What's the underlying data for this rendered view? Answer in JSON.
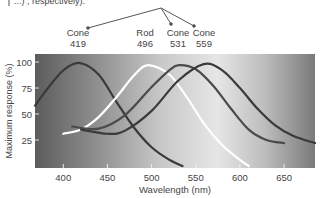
{
  "caption_fragment": "...) , respectively).",
  "chart_data": {
    "type": "line",
    "title": "",
    "xlabel": "Wavelength (nm)",
    "ylabel": "Maximum response (%)",
    "xlim": [
      368,
      685
    ],
    "ylim": [
      0,
      103
    ],
    "xticks": [
      400,
      450,
      500,
      550,
      600,
      650
    ],
    "yticks": [
      25,
      50,
      75,
      100
    ],
    "grid": false,
    "legend": "annotations above plot",
    "background": "grayscale gradient: dark at violet end, light around 550-600 nm, darker toward red end",
    "series": [
      {
        "name": "Cone 419",
        "peak_nm": 419,
        "color": "#3a3a3a",
        "x": [
          368,
          380,
          400,
          419,
          440,
          460,
          480,
          500,
          520,
          535
        ],
        "y": [
          58,
          72,
          92,
          99,
          88,
          62,
          37,
          18,
          6,
          0
        ]
      },
      {
        "name": "Rod 496",
        "peak_nm": 496,
        "color": "#ffffff",
        "x": [
          400,
          420,
          440,
          460,
          480,
          496,
          520,
          540,
          560,
          580,
          600,
          610
        ],
        "y": [
          31,
          35,
          47,
          66,
          87,
          97,
          88,
          66,
          40,
          20,
          6,
          0
        ]
      },
      {
        "name": "Cone 531",
        "peak_nm": 531,
        "color": "#4a4a4a",
        "x": [
          410,
          440,
          470,
          500,
          520,
          531,
          550,
          570,
          590,
          610,
          630,
          650
        ],
        "y": [
          38,
          36,
          49,
          76,
          92,
          97,
          93,
          77,
          55,
          35,
          25,
          22
        ]
      },
      {
        "name": "Cone 559",
        "peak_nm": 559,
        "color": "#3a3a3a",
        "x": [
          420,
          450,
          470,
          500,
          530,
          559,
          580,
          600,
          620,
          640,
          660,
          685
        ],
        "y": [
          35,
          31,
          34,
          53,
          82,
          98,
          92,
          75,
          55,
          39,
          29,
          22
        ]
      }
    ],
    "annotations": [
      {
        "label": "Cone",
        "value": "419"
      },
      {
        "label": "Rod",
        "value": "496"
      },
      {
        "label": "Cone",
        "value": "531"
      },
      {
        "label": "Cone",
        "value": "559"
      }
    ]
  }
}
